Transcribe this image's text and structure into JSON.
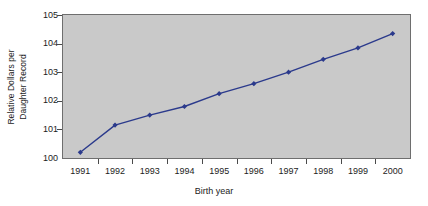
{
  "chart_data": {
    "type": "line",
    "title": "",
    "xlabel": "Birth year",
    "ylabel": "Relative Dollars per Daughter Record",
    "ylabel_lines": [
      "Relative Dollars per",
      "Daughter Record"
    ],
    "categories": [
      "1991",
      "1992",
      "1993",
      "1994",
      "1995",
      "1996",
      "1997",
      "1998",
      "1999",
      "2000"
    ],
    "x": [
      1991,
      1992,
      1993,
      1994,
      1995,
      1996,
      1997,
      1998,
      1999,
      2000
    ],
    "values": [
      100.2,
      101.15,
      101.5,
      101.8,
      102.25,
      102.6,
      103.0,
      103.45,
      103.85,
      104.35
    ],
    "series": [
      {
        "name": "Relative Dollars per Daughter Record",
        "values": [
          100.2,
          101.15,
          101.5,
          101.8,
          102.25,
          102.6,
          103.0,
          103.45,
          103.85,
          104.35
        ]
      }
    ],
    "ylim": [
      100,
      105
    ],
    "xlim": [
      1990.5,
      2000.5
    ],
    "yticks": [
      100,
      101,
      102,
      103,
      104,
      105
    ],
    "ytick_labels": [
      "100",
      "101",
      "102",
      "103",
      "104",
      "105"
    ],
    "xticks": [
      1991,
      1992,
      1993,
      1994,
      1995,
      1996,
      1997,
      1998,
      1999,
      2000
    ],
    "grid": false,
    "legend": false,
    "marker": "diamond",
    "line_color": "#2b3a8c",
    "marker_color": "#2b3a8c",
    "plot_background": "#c9c9c9",
    "figure_background": "#ffffff",
    "axis_color": "#6e6e6e",
    "text_color": "#1c1c1c"
  }
}
